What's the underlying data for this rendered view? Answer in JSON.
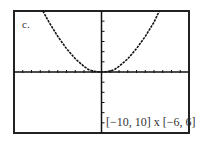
{
  "panel_label": "c.",
  "window_label": "[−10, 10] x [−6, 6]",
  "chart_data": {
    "type": "line",
    "title": "",
    "xlabel": "",
    "ylabel": "",
    "xlim": [
      -10,
      10
    ],
    "ylim": [
      -6,
      6
    ],
    "xscl": 1,
    "yscl": 1,
    "grid": false,
    "window_text": "[−10, 10] x [−6, 6]",
    "series": [
      {
        "name": "curve",
        "x": [
          -6.7,
          -6,
          -5,
          -4,
          -3,
          -2,
          -1.5,
          -1,
          -0.5,
          0,
          0.5,
          1,
          1.5,
          2,
          3,
          4,
          5,
          6,
          6.6
        ],
        "y": [
          6,
          4.9,
          3.5,
          2.3,
          1.3,
          0.55,
          0.25,
          0.1,
          0.02,
          0,
          0.02,
          0.1,
          0.25,
          0.55,
          1.3,
          2.3,
          3.5,
          4.9,
          6
        ]
      }
    ]
  },
  "colors": {
    "frame": "#222222",
    "axis": "#111111",
    "curve": "#111111",
    "text": "#333333"
  }
}
